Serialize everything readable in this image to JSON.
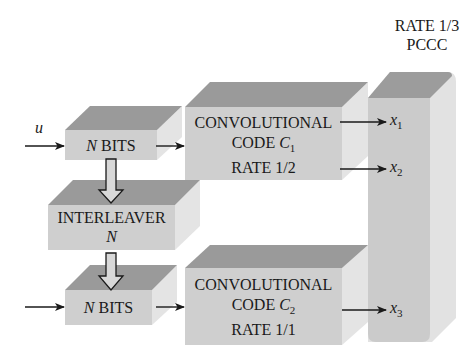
{
  "title": {
    "line1": "RATE 1/3",
    "line2": "PCCC"
  },
  "input_label": "u",
  "blocks": {
    "nbits_top": {
      "var": "N",
      "text": " BITS"
    },
    "interleaver": {
      "line1": "INTERLEAVER",
      "line2": "N"
    },
    "nbits_bottom": {
      "var": "N",
      "text": " BITS"
    },
    "conv1": {
      "line1": "CONVOLUTIONAL",
      "line2_text": "CODE ",
      "line2_var": "C",
      "line2_sub": "1",
      "line3": "RATE 1/2"
    },
    "conv2": {
      "line1": "CONVOLUTIONAL",
      "line2_text": "CODE ",
      "line2_var": "C",
      "line2_sub": "2",
      "line3": "RATE 1/1"
    }
  },
  "outputs": [
    {
      "var": "x",
      "sub": "1"
    },
    {
      "var": "x",
      "sub": "2"
    },
    {
      "var": "x",
      "sub": "3"
    }
  ],
  "colors": {
    "front": "#cfcfcf",
    "top": "#9a9a9a",
    "side": "#e4e4e4",
    "arrow": "#1a1a1a"
  }
}
